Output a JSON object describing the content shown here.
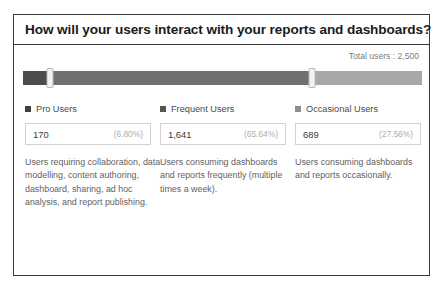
{
  "panel": {
    "title": "How will your users interact with your reports and dashboards?",
    "total_users_label": "Total users : 2,500"
  },
  "chart_data": {
    "type": "bar",
    "title": "How will your users interact with your reports and dashboards?",
    "subtitle": "Total users : 2,500",
    "xlabel": "",
    "ylabel": "",
    "total_users": 2500,
    "categories": [
      "Pro Users",
      "Frequent Users",
      "Occasional Users"
    ],
    "values": [
      170,
      1641,
      689
    ],
    "value_labels": [
      "170",
      "1,641",
      "689"
    ],
    "percentages": [
      6.8,
      65.64,
      27.56
    ],
    "percent_labels": [
      "(6.80%)",
      "(65.64%)",
      "(27.56%)"
    ],
    "colors": [
      "#4c4c4c",
      "#717171",
      "#a8a8a8"
    ],
    "legend_position": "below-bar",
    "grid": false,
    "segments": [
      {
        "name": "Pro Users",
        "width_pct": 6.8,
        "color": "#4c4c4c"
      },
      {
        "name": "Frequent Users",
        "width_pct": 65.64,
        "color": "#717171"
      },
      {
        "name": "Occasional Users",
        "width_pct": 27.56,
        "color": "#a8a8a8"
      }
    ],
    "handles": [
      {
        "name": "handle-1",
        "position_pct": 6.8
      },
      {
        "name": "handle-2",
        "position_pct": 72.44
      }
    ]
  },
  "columns": [
    {
      "marker_color": "#3f3f3f",
      "label": "Pro Users",
      "value": "170",
      "percent": "(6.80%)",
      "description": "Users requiring collaboration, data modelling, content authoring, dashboard, sharing, ad hoc analysis, and report publishing."
    },
    {
      "marker_color": "#555555",
      "label": "Frequent Users",
      "value": "1,641",
      "percent": "(65.64%)",
      "description": "Users consuming dashboards and reports frequently (multiple times a week)."
    },
    {
      "marker_color": "#8c8c8c",
      "label": "Occasional Users",
      "value": "689",
      "percent": "(27.56%)",
      "description": "Users consuming dashboards and reports occasionally."
    }
  ]
}
